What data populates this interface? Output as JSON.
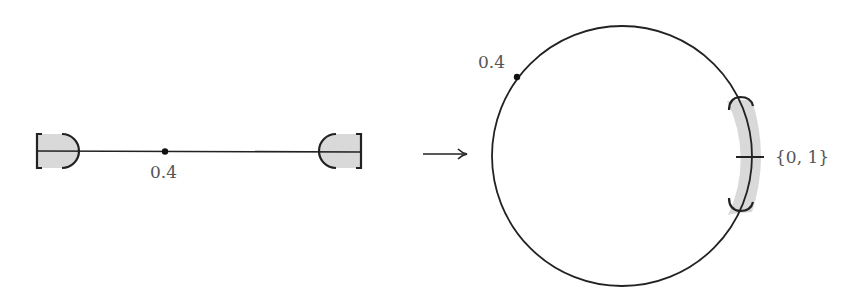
{
  "diagram": {
    "left": {
      "point_label": "0.4",
      "point_position": 0.4,
      "shaded_ends": [
        "0",
        "1"
      ]
    },
    "arrow": {
      "direction": "right"
    },
    "right": {
      "point_label": "0.4",
      "endpoint_label": "{0, 1}"
    },
    "colors": {
      "stroke": "#222222",
      "shade": "#d9d9d9",
      "label": "#555555"
    }
  }
}
